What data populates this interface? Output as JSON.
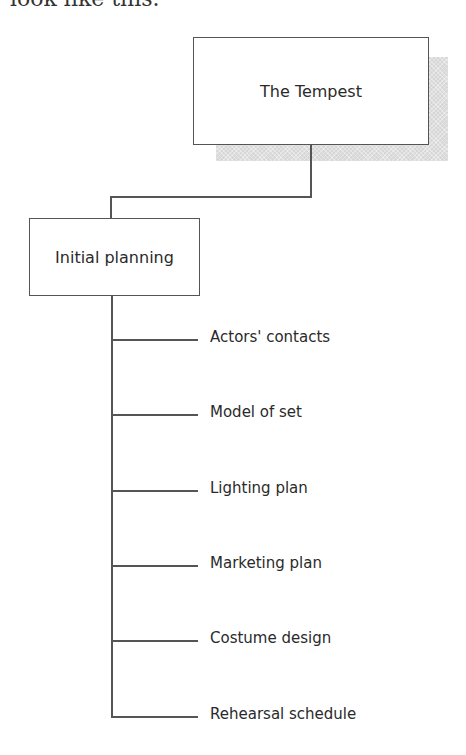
{
  "heading_fragment": "look like this.",
  "diagram": {
    "root": {
      "label": "The Tempest"
    },
    "child": {
      "label": "Initial planning"
    },
    "tasks": [
      {
        "label": "Actors' contacts",
        "y": 339
      },
      {
        "label": "Model of set",
        "y": 414
      },
      {
        "label": "Lighting plan",
        "y": 490
      },
      {
        "label": "Marketing plan",
        "y": 565
      },
      {
        "label": "Costume design",
        "y": 640
      },
      {
        "label": "Rehearsal schedule",
        "y": 716
      }
    ]
  },
  "colors": {
    "line": "#555555",
    "shadow": "#d6d6d6",
    "text": "#2a2a2a",
    "background": "#ffffff"
  }
}
